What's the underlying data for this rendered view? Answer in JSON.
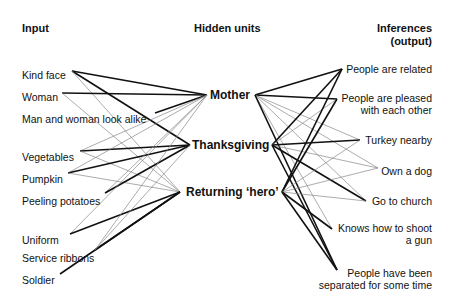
{
  "headers": {
    "input": "Input",
    "hidden": "Hidden units",
    "output_line1": "Inferences",
    "output_line2": "(output)"
  },
  "inputs": [
    {
      "label": "Kind face",
      "x": 22,
      "y": 69,
      "ax": 72,
      "ay": 71
    },
    {
      "label": "Woman",
      "x": 22,
      "y": 91,
      "ax": 62,
      "ay": 93
    },
    {
      "label": "Man and woman look alike",
      "x": 22,
      "y": 113,
      "ax": 155,
      "ay": 113
    },
    {
      "label": "Vegetables",
      "x": 22,
      "y": 151,
      "ax": 80,
      "ay": 151
    },
    {
      "label": "Pumpkin",
      "x": 22,
      "y": 173,
      "ax": 68,
      "ay": 173
    },
    {
      "label": "Peeling potatoes",
      "x": 22,
      "y": 195,
      "ax": 105,
      "ay": 193
    },
    {
      "label": "Uniform",
      "x": 22,
      "y": 234,
      "ax": 70,
      "ay": 234
    },
    {
      "label": "Service ribbons",
      "x": 22,
      "y": 252,
      "ax": 95,
      "ay": 250
    },
    {
      "label": "Soldier",
      "x": 22,
      "y": 274,
      "ax": 60,
      "ay": 274
    }
  ],
  "hidden_units": [
    {
      "label": "Mother",
      "x": 210,
      "y": 88,
      "lx": 207,
      "ly": 95,
      "rx": 255,
      "ry": 95
    },
    {
      "label": "Thanksgiving",
      "x": 192,
      "y": 138,
      "lx": 190,
      "ly": 145,
      "rx": 272,
      "ry": 145
    },
    {
      "label": "Returning ‘hero’",
      "x": 186,
      "y": 185,
      "lx": 180,
      "ly": 192,
      "rx": 282,
      "ry": 192
    }
  ],
  "outputs": [
    {
      "lines": [
        "People are related"
      ],
      "rx": 432,
      "y": 63,
      "ax": 342,
      "ay": 69
    },
    {
      "lines": [
        "People are pleased",
        "with each other"
      ],
      "rx": 432,
      "y": 92,
      "ax": 337,
      "ay": 99
    },
    {
      "lines": [
        "Turkey nearby"
      ],
      "rx": 432,
      "y": 134,
      "ax": 360,
      "ay": 140
    },
    {
      "lines": [
        "Own a dog"
      ],
      "rx": 432,
      "y": 165,
      "ax": 378,
      "ay": 168
    },
    {
      "lines": [
        "Go to church"
      ],
      "rx": 432,
      "y": 195,
      "ax": 366,
      "ay": 201
    },
    {
      "lines": [
        "Knows how to shoot",
        "a gun"
      ],
      "rx": 432,
      "y": 222,
      "ax": 332,
      "ay": 229
    },
    {
      "lines": [
        "People have been",
        "separated for some time"
      ],
      "rx": 432,
      "y": 267,
      "ax": 337,
      "ay": 270
    }
  ],
  "connections": [
    {
      "from": "in",
      "i": 0,
      "h": 0,
      "w": "strong"
    },
    {
      "from": "in",
      "i": 0,
      "h": 1,
      "w": "strong"
    },
    {
      "from": "in",
      "i": 0,
      "h": 2,
      "w": "weak"
    },
    {
      "from": "in",
      "i": 1,
      "h": 0,
      "w": "strong"
    },
    {
      "from": "in",
      "i": 1,
      "h": 2,
      "w": "weak"
    },
    {
      "from": "in",
      "i": 2,
      "h": 0,
      "w": "strong"
    },
    {
      "from": "in",
      "i": 3,
      "h": 0,
      "w": "weak"
    },
    {
      "from": "in",
      "i": 3,
      "h": 1,
      "w": "strong"
    },
    {
      "from": "in",
      "i": 3,
      "h": 2,
      "w": "weak"
    },
    {
      "from": "in",
      "i": 4,
      "h": 0,
      "w": "weak"
    },
    {
      "from": "in",
      "i": 4,
      "h": 1,
      "w": "strong"
    },
    {
      "from": "in",
      "i": 4,
      "h": 2,
      "w": "weak"
    },
    {
      "from": "in",
      "i": 5,
      "h": 0,
      "w": "weak"
    },
    {
      "from": "in",
      "i": 5,
      "h": 1,
      "w": "strong"
    },
    {
      "from": "in",
      "i": 6,
      "h": 0,
      "w": "weak"
    },
    {
      "from": "in",
      "i": 6,
      "h": 2,
      "w": "strong"
    },
    {
      "from": "in",
      "i": 7,
      "h": 0,
      "w": "weak"
    },
    {
      "from": "in",
      "i": 7,
      "h": 2,
      "w": "strong"
    },
    {
      "from": "in",
      "i": 8,
      "h": 2,
      "w": "strong"
    },
    {
      "from": "in",
      "i": 7,
      "h": 1,
      "w": "weak"
    },
    {
      "from": "out",
      "h": 0,
      "o": 0,
      "w": "strong"
    },
    {
      "from": "out",
      "h": 0,
      "o": 1,
      "w": "strong"
    },
    {
      "from": "out",
      "h": 0,
      "o": 2,
      "w": "weak"
    },
    {
      "from": "out",
      "h": 0,
      "o": 3,
      "w": "weak"
    },
    {
      "from": "out",
      "h": 0,
      "o": 4,
      "w": "weak"
    },
    {
      "from": "out",
      "h": 0,
      "o": 5,
      "w": "weak"
    },
    {
      "from": "out",
      "h": 0,
      "o": 6,
      "w": "strong"
    },
    {
      "from": "out",
      "h": 1,
      "o": 0,
      "w": "strong"
    },
    {
      "from": "out",
      "h": 1,
      "o": 1,
      "w": "weak"
    },
    {
      "from": "out",
      "h": 1,
      "o": 2,
      "w": "strong"
    },
    {
      "from": "out",
      "h": 1,
      "o": 3,
      "w": "weak"
    },
    {
      "from": "out",
      "h": 1,
      "o": 4,
      "w": "strong"
    },
    {
      "from": "out",
      "h": 1,
      "o": 6,
      "w": "strong"
    },
    {
      "from": "out",
      "h": 2,
      "o": 0,
      "w": "strong"
    },
    {
      "from": "out",
      "h": 2,
      "o": 1,
      "w": "strong"
    },
    {
      "from": "out",
      "h": 2,
      "o": 2,
      "w": "weak"
    },
    {
      "from": "out",
      "h": 2,
      "o": 3,
      "w": "weak"
    },
    {
      "from": "out",
      "h": 2,
      "o": 4,
      "w": "weak"
    },
    {
      "from": "out",
      "h": 2,
      "o": 5,
      "w": "strong"
    },
    {
      "from": "out",
      "h": 2,
      "o": 6,
      "w": "strong"
    }
  ],
  "styles": {
    "strong_color": "#111111",
    "weak_color": "#888888",
    "strong_width": 1.6,
    "weak_width": 0.7
  }
}
